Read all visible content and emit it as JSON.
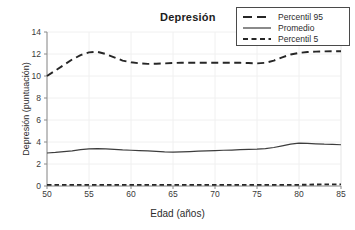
{
  "chart_data": {
    "type": "line",
    "title": "Depresión",
    "xlabel": "Edad (años)",
    "ylabel": "Depresión (puntuación)",
    "xlim": [
      50,
      85
    ],
    "ylim": [
      0,
      14
    ],
    "xticks": [
      "50",
      "55",
      "60",
      "65",
      "70",
      "75",
      "80",
      "85"
    ],
    "yticks": [
      "0",
      "2",
      "4",
      "6",
      "8",
      "10",
      "12",
      "14"
    ],
    "grid": true,
    "grid_style": "faint vertical and horizontal gridlines",
    "legend_position": "top-right",
    "x": [
      50,
      51,
      52,
      53,
      54,
      55,
      56,
      57,
      58,
      59,
      60,
      61,
      62,
      63,
      64,
      65,
      66,
      67,
      68,
      69,
      70,
      71,
      72,
      73,
      74,
      75,
      76,
      77,
      78,
      79,
      80,
      81,
      82,
      83,
      84,
      85
    ],
    "series": [
      {
        "name": "Percentil 95",
        "style": "long-dash",
        "color": "#262626",
        "values": [
          10.0,
          10.5,
          11.0,
          11.5,
          11.9,
          12.15,
          12.2,
          12.0,
          11.7,
          11.4,
          11.25,
          11.15,
          11.1,
          11.12,
          11.15,
          11.18,
          11.2,
          11.2,
          11.2,
          11.2,
          11.2,
          11.2,
          11.2,
          11.2,
          11.18,
          11.15,
          11.2,
          11.4,
          11.7,
          11.95,
          12.1,
          12.18,
          12.22,
          12.24,
          12.25,
          12.25
        ]
      },
      {
        "name": "Promedio",
        "style": "solid",
        "color": "#3d3d3d",
        "values": [
          3.0,
          3.05,
          3.12,
          3.2,
          3.3,
          3.37,
          3.4,
          3.38,
          3.33,
          3.28,
          3.25,
          3.22,
          3.2,
          3.15,
          3.1,
          3.08,
          3.1,
          3.13,
          3.16,
          3.19,
          3.22,
          3.25,
          3.27,
          3.3,
          3.32,
          3.35,
          3.4,
          3.5,
          3.65,
          3.8,
          3.9,
          3.88,
          3.84,
          3.8,
          3.78,
          3.75
        ]
      },
      {
        "name": "Percentil 5",
        "style": "short-dash",
        "color": "#262626",
        "values": [
          0.1,
          0.1,
          0.1,
          0.1,
          0.1,
          0.1,
          0.1,
          0.1,
          0.1,
          0.1,
          0.1,
          0.1,
          0.1,
          0.1,
          0.1,
          0.1,
          0.1,
          0.1,
          0.1,
          0.1,
          0.1,
          0.1,
          0.1,
          0.1,
          0.1,
          0.1,
          0.1,
          0.1,
          0.1,
          0.1,
          0.1,
          0.12,
          0.14,
          0.15,
          0.15,
          0.15
        ]
      }
    ]
  },
  "legend": {
    "items": [
      {
        "label": "Percentil 95"
      },
      {
        "label": "Promedio"
      },
      {
        "label": "Percentil 5"
      }
    ]
  }
}
